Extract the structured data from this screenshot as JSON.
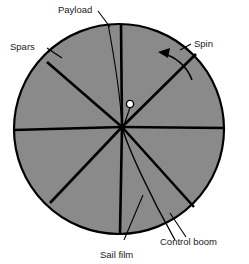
{
  "figure": {
    "name": "spinning-solar-sail-diagram",
    "background_color": "#ffffff",
    "sail": {
      "fill_color": "#8a8a8a",
      "stroke_color": "#000000",
      "center_x": 119,
      "center_y": 129,
      "radius": 105,
      "outline_width": 2.2
    },
    "hub": {
      "x": 122,
      "y": 127,
      "radius": 3.2,
      "color": "#000000"
    },
    "payload_dot": {
      "x": 130,
      "y": 104,
      "radius": 3.6,
      "fill_color": "#ffffff",
      "stroke_color": "#000000"
    },
    "spars": {
      "count": 8,
      "stroke_color": "#000000",
      "stroke_width": 2.6,
      "angles_deg": [
        90,
        45,
        0,
        312,
        270,
        225,
        180,
        128
      ]
    },
    "control_boom": {
      "stroke_color": "#000000",
      "stroke_width": 1.3,
      "description": "thin line from hub to sail rim, lower right"
    },
    "spin": {
      "direction": "counterclockwise",
      "arrow_color": "#000000"
    }
  },
  "labels": {
    "payload": "Payload",
    "spars": "Spars",
    "spin": "Spin",
    "sail_film": "Sail film",
    "control_boom": "Control boom"
  }
}
